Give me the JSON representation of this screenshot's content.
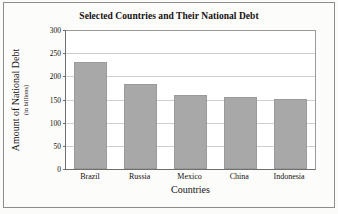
{
  "chart_data": {
    "type": "bar",
    "title": "Selected Countries and Their National Debt",
    "xlabel": "Countries",
    "ylabel": "Amount of National Debt",
    "ylabel_sub": "(in billions)",
    "categories": [
      "Brazil",
      "Russia",
      "Mexico",
      "China",
      "Indonesia"
    ],
    "values": [
      232,
      184,
      160,
      155,
      152
    ],
    "yticks": [
      0,
      50,
      100,
      150,
      200,
      250,
      300
    ],
    "ylim": [
      0,
      300
    ],
    "grid": true,
    "legend": false,
    "colors": {
      "bar_fill": "#a8a8a8",
      "bar_stroke": "#9a9a9a",
      "gridline": "#cfcfcf",
      "axis": "#6e6e6e",
      "text": "#15110f",
      "plot_background": "#ffffff",
      "figure_background": "#fcfcfb",
      "frame_border": "#8d8d8d"
    }
  }
}
